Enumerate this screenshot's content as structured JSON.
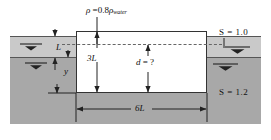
{
  "figure": {
    "labels": {
      "density": "ρ",
      "density_eq": " =0.8",
      "density_rho2": "ρ",
      "density_sub": "water",
      "s_top": "S  =  1.0",
      "s_bottom": "S  =  1.2",
      "dim_L": "L",
      "dim_y": "y",
      "dim_3L": "3L",
      "dim_d": "d",
      "dim_d_eq": "  =  ?",
      "dim_6L": "6L"
    },
    "colors": {
      "light_fluid": "#c9c9c9",
      "heavy_fluid": "#a8a8a8",
      "block_fill": "#ffffff",
      "line": "#333333",
      "dashed_line": "#666666"
    },
    "icons": {
      "free_surface": "free-surface-symbol"
    },
    "geometry": {
      "block_width_label": "6L",
      "block_height_label": "3L",
      "submerged_depth_label": "d",
      "upper_layer_thickness_label": "L",
      "lower_draft_label": "y"
    }
  }
}
